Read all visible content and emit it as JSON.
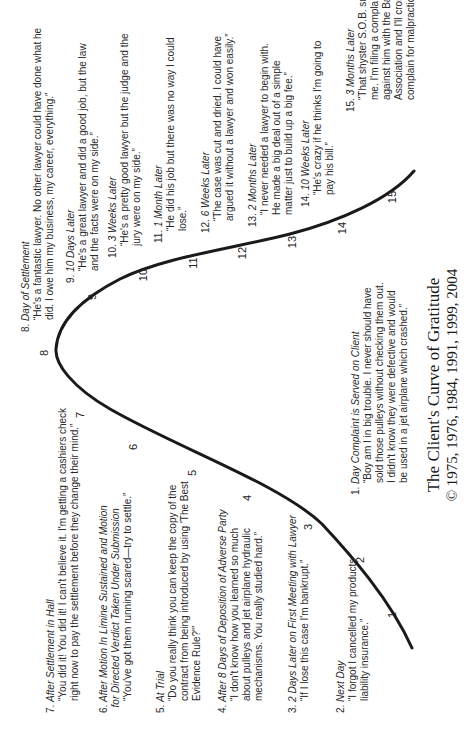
{
  "title": "The Client's Curve of Gratitude",
  "copyright": "© 1975, 1976, 1984, 1991, 1999, 2004",
  "curve": {
    "stroke": "#1a1a1a",
    "path": "M 101 412 C 150 390, 195 350, 225 322 C 265 280, 300 180, 340 110 C 362 72, 385 55, 400 56 C 430 58, 452 85, 470 120 C 492 165, 500 230, 515 290 C 528 340, 550 390, 578 414"
  },
  "numbers": [
    {
      "n": "1",
      "x": 134,
      "y": 392
    },
    {
      "n": "2",
      "x": 189,
      "y": 360
    },
    {
      "n": "3",
      "x": 222,
      "y": 308
    },
    {
      "n": "4",
      "x": 251,
      "y": 247
    },
    {
      "n": "5",
      "x": 276,
      "y": 192
    },
    {
      "n": "6",
      "x": 302,
      "y": 133
    },
    {
      "n": "7",
      "x": 334,
      "y": 80
    },
    {
      "n": "8",
      "x": 396,
      "y": 44
    },
    {
      "n": "9",
      "x": 452,
      "y": 92
    },
    {
      "n": "10",
      "x": 474,
      "y": 143
    },
    {
      "n": "11",
      "x": 486,
      "y": 193
    },
    {
      "n": "12",
      "x": 496,
      "y": 242
    },
    {
      "n": "13",
      "x": 507,
      "y": 292
    },
    {
      "n": "14",
      "x": 521,
      "y": 342
    },
    {
      "n": "15",
      "x": 552,
      "y": 392
    }
  ],
  "items": [
    {
      "num": "1.",
      "when": "Day Complaint is Served on Client",
      "quote": "“Boy am I in big trouble. I never should have\nsold those pulleys without checking them out.\nI didn't know they were defective and would\nbe used in a jet airplane which crashed.”",
      "x": 254,
      "y": 350
    },
    {
      "num": "2.",
      "when": "Next Day",
      "quote": "“I forgot I cancelled my products\nliability insurance.”",
      "x": 36,
      "y": 335
    },
    {
      "num": "3.",
      "when": "2 Days Later on First Meeting with Lawyer",
      "quote": "“If I lose this case I'm bankrupt.”",
      "x": 36,
      "y": 287
    },
    {
      "num": "4.",
      "when": "After 8 Days of Deposition of Adverse Party",
      "quote": "“I don't know how you learned so much\nabout pulleys and jet airplane hydraulic\nmechanisms. You really studied hard.”",
      "x": 36,
      "y": 217
    },
    {
      "num": "5.",
      "when": "At Trial",
      "quote": "“Do you really think you can keep the copy of the\ncontract from being introduced by using 'The Best\nEvidence Rule?'”",
      "x": 36,
      "y": 155
    },
    {
      "num": "6.",
      "when": "After Motion In Limine Sustained and Motion\n  for Directed Verdict Taken Under Submission",
      "quote": "“You've got them running scared—try to settle.”",
      "x": 36,
      "y": 98
    },
    {
      "num": "7.",
      "when": "After Settlement in Hall",
      "quote": "“You did it! You did it! I can't believe it. I'm getting a cashiers check\nright now to pay the settlement before they change their mind.”",
      "x": 36,
      "y": 45
    },
    {
      "num": "8.",
      "when": "Day of Settlement",
      "quote": "“He's a fantastic lawyer. No other lawyer could have done what he\ndid. I owe him my business, my career, everything.”",
      "x": 417,
      "y": 20
    },
    {
      "num": "9.",
      "when": "10 Days Later",
      "quote": "“He's a great lawyer and did a good job, but the law\nand the facts were on my side.”",
      "x": 466,
      "y": 65
    },
    {
      "num": "10.",
      "when": "3 Weeks Later",
      "quote": "“He's a pretty good lawyer but the judge and the\njury were on my side.”",
      "x": 491,
      "y": 107
    },
    {
      "num": "11.",
      "when": "1 Month Later",
      "quote": "“He did his job but there was no way I could\nlose.”",
      "x": 506,
      "y": 153
    },
    {
      "num": "12.",
      "when": "6 Weeks Later",
      "quote": "“The case was cut and dried. I could have\nargued it without a lawyer and won easily.”",
      "x": 516,
      "y": 200
    },
    {
      "num": "13.",
      "when": "2 Months Later",
      "quote": "“I never needed a lawyer to begin with.\nHe made a big deal out of a simple\nmatter just to build up a big fee.”",
      "x": 522,
      "y": 247
    },
    {
      "num": "14.",
      "when": "10 Weeks Later",
      "quote": "“He's crazy if he thinks I'm going to\npay his bill.”",
      "x": 542,
      "y": 300
    },
    {
      "num": "15.",
      "when": "3 Months Later",
      "quote": "“That shyster S.O.B. sued\nme. I'm filing a complaint\nagainst him with the Bar\nAssociation and I'll cross-\ncomplain for malpractice.”",
      "x": 637,
      "y": 345
    }
  ]
}
